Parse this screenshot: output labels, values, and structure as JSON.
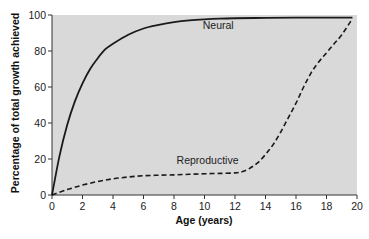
{
  "chart_data": {
    "type": "line",
    "title": "",
    "xlabel": "Age (years)",
    "ylabel": "Percentage of total growth achieved",
    "xlim": [
      0,
      20
    ],
    "ylim": [
      0,
      100
    ],
    "xticks": [
      0,
      2,
      4,
      6,
      8,
      10,
      12,
      14,
      16,
      18,
      20
    ],
    "yticks": [
      0,
      20,
      40,
      60,
      80,
      100
    ],
    "grid": false,
    "legend": "inline labels",
    "background": "#d9d9d9",
    "series": [
      {
        "name": "Neural",
        "style": "solid",
        "label_position": {
          "x": 10.9,
          "y": 92
        },
        "x": [
          0,
          0.5,
          1,
          1.5,
          2,
          2.5,
          3,
          3.5,
          4,
          5,
          6,
          7,
          8,
          9,
          10,
          11,
          12,
          14,
          16,
          18,
          19.7
        ],
        "values": [
          0,
          22,
          39,
          52,
          62,
          70,
          76,
          81,
          84,
          89,
          92.5,
          94.5,
          96,
          97,
          97.6,
          98,
          98.2,
          98.4,
          98.5,
          98.5,
          98.5
        ]
      },
      {
        "name": "Reproductive",
        "style": "dashed",
        "label_position": {
          "x": 10.2,
          "y": 17
        },
        "x": [
          0,
          1,
          2,
          3,
          4,
          5,
          6,
          7,
          8,
          9,
          10,
          11,
          12,
          12.5,
          13,
          13.5,
          14,
          14.5,
          15,
          15.5,
          16,
          16.5,
          17,
          17.5,
          18,
          18.5,
          19,
          19.7
        ],
        "values": [
          0,
          3,
          5.5,
          7.5,
          9,
          10,
          10.7,
          11,
          11.2,
          11.5,
          11.8,
          12,
          12.3,
          13,
          15,
          18,
          22.5,
          28,
          35,
          43,
          51,
          60,
          68,
          74,
          79,
          84,
          89,
          98
        ]
      }
    ]
  }
}
